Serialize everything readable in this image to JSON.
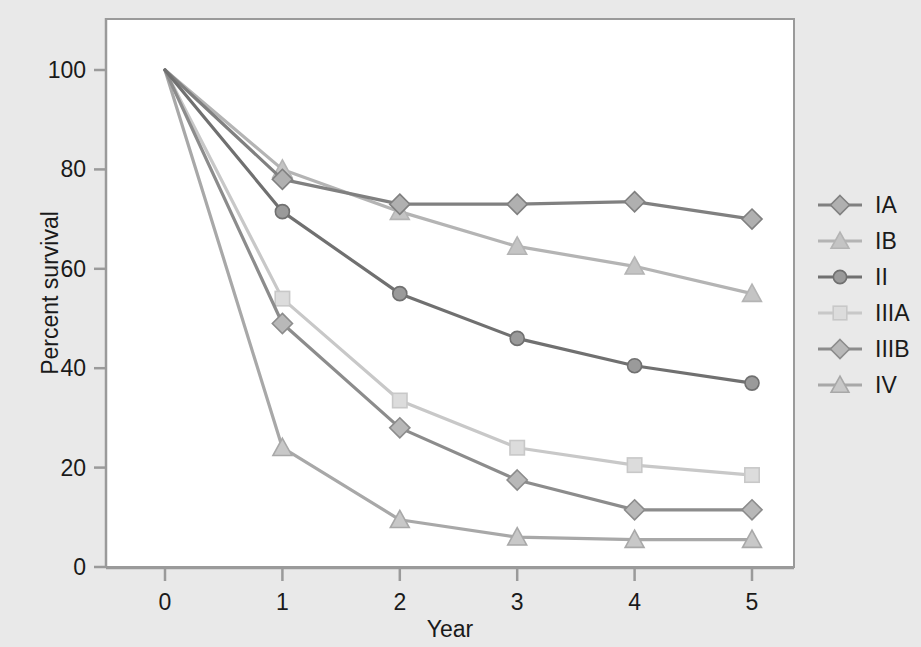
{
  "figure": {
    "background_color": "#e9e9e9",
    "plot_background_color": "#ffffff",
    "frame_color": "#9a9a9a"
  },
  "axes": {
    "x_title": "Year",
    "y_title": "Percent survival",
    "x_ticks": [
      "0",
      "1",
      "2",
      "3",
      "4",
      "5"
    ],
    "y_ticks": [
      "0",
      "20",
      "40",
      "60",
      "80",
      "100"
    ]
  },
  "legend": {
    "position": "right",
    "items": [
      {
        "label": "IA",
        "color": "#808080",
        "marker": "diamond",
        "marker_fill": "#b0b0b0"
      },
      {
        "label": "IB",
        "color": "#b4b4b4",
        "marker": "triangle",
        "marker_fill": "#c4c4c4"
      },
      {
        "label": "II",
        "color": "#707070",
        "marker": "circle",
        "marker_fill": "#9a9a9a"
      },
      {
        "label": "IIIA",
        "color": "#c8c8c8",
        "marker": "square",
        "marker_fill": "#dcdcdc"
      },
      {
        "label": "IIIB",
        "color": "#8c8c8c",
        "marker": "diamond",
        "marker_fill": "#b8b8b8"
      },
      {
        "label": "IV",
        "color": "#a8a8a8",
        "marker": "triangle",
        "marker_fill": "#c8c8c8"
      }
    ]
  },
  "chart_data": {
    "type": "line",
    "title": "",
    "xlabel": "Year",
    "ylabel": "Percent survival",
    "x": [
      0,
      1,
      2,
      3,
      4,
      5
    ],
    "xlim": [
      0,
      5
    ],
    "ylim": [
      0,
      100
    ],
    "grid": false,
    "legend_position": "right",
    "series": [
      {
        "name": "IA",
        "marker": "diamond",
        "color": "#808080",
        "values": [
          100,
          78,
          73,
          73,
          73.5,
          70
        ]
      },
      {
        "name": "IB",
        "marker": "triangle",
        "color": "#b4b4b4",
        "values": [
          100,
          80,
          71.5,
          64.5,
          60.5,
          55
        ]
      },
      {
        "name": "II",
        "marker": "circle",
        "color": "#707070",
        "values": [
          100,
          71.5,
          55,
          46,
          40.5,
          37
        ]
      },
      {
        "name": "IIIA",
        "marker": "square",
        "color": "#c8c8c8",
        "values": [
          100,
          54,
          33.5,
          24,
          20.5,
          18.5
        ]
      },
      {
        "name": "IIIB",
        "marker": "diamond",
        "color": "#8c8c8c",
        "values": [
          100,
          49,
          28,
          17.5,
          11.5,
          11.5
        ]
      },
      {
        "name": "IV",
        "marker": "triangle",
        "color": "#a8a8a8",
        "values": [
          100,
          24,
          9.5,
          6,
          5.5,
          5.5
        ]
      }
    ]
  }
}
